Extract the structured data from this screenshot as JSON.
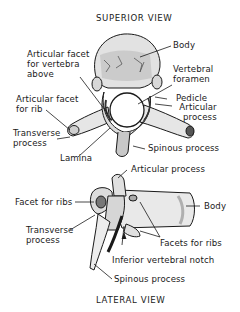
{
  "diagram": {
    "superior_view": {
      "title": "SUPERIOR VIEW",
      "labels": {
        "body": "Body",
        "articular_facet_above_1": "Articular facet",
        "articular_facet_above_2": "for vertebra",
        "articular_facet_above_3": "above",
        "vertebral_foramen_1": "Vertebral",
        "vertebral_foramen_2": "foramen",
        "articular_facet_rib_1": "Articular facet",
        "articular_facet_rib_2": "for rib",
        "pedicle": "Pedicle",
        "articular_process_1": "Articular",
        "articular_process_2": "process",
        "transverse_process_1": "Transverse",
        "transverse_process_2": "process",
        "lamina": "Lamina",
        "spinous_process": "Spinous process"
      }
    },
    "lateral_view": {
      "title": "LATERAL VIEW",
      "labels": {
        "articular_process": "Articular process",
        "facet_for_ribs": "Facet for ribs",
        "body": "Body",
        "transverse_process_1": "Transverse",
        "transverse_process_2": "process",
        "facets_for_ribs": "Facets for ribs",
        "inferior_vertebral_notch": "Inferior vertebral notch",
        "spinous_process": "Spinous process"
      }
    },
    "colors": {
      "ink": "#1a1a1a",
      "bone_fill": "#eeeeee",
      "bone_shade": "#9a9a9a",
      "background": "#ffffff"
    }
  }
}
